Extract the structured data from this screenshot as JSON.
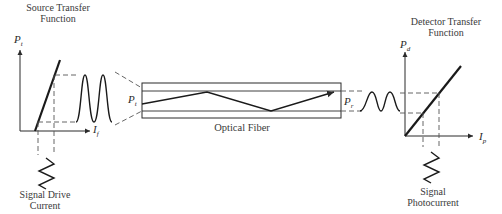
{
  "source": {
    "title_line1": "Source Transfer",
    "title_line2": "Function",
    "y_axis_label": "P",
    "y_axis_sub": "t",
    "x_axis_label": "I",
    "x_axis_sub": "f",
    "input_label_line1": "Signal Drive",
    "input_label_line2": "Current"
  },
  "fiber": {
    "label": "Optical Fiber",
    "input_power_label": "P",
    "input_power_sub": "t",
    "output_power_label": "P",
    "output_power_sub": "r"
  },
  "detector": {
    "title_line1": "Detector Transfer",
    "title_line2": "Function",
    "y_axis_label": "P",
    "y_axis_sub": "d",
    "x_axis_label": "I",
    "x_axis_sub": "p",
    "output_label_line1": "Signal",
    "output_label_line2": "Photocurrent"
  },
  "colors": {
    "line": "#2a2a2a",
    "dashed": "#555555"
  }
}
